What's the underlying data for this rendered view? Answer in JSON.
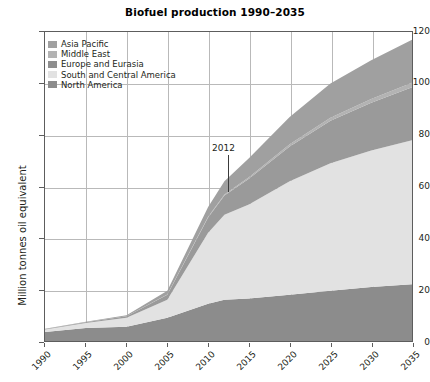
{
  "chart_data": {
    "type": "area",
    "title": "Biofuel production 1990–2035",
    "xlabel": "",
    "ylabel": "Million tonnes oil equivalent",
    "xlim": [
      1990,
      2035
    ],
    "ylim": [
      0,
      120
    ],
    "yticks": [
      0,
      20,
      40,
      60,
      80,
      100,
      120
    ],
    "xticks": [
      1990,
      1995,
      2000,
      2005,
      2010,
      2015,
      2020,
      2025,
      2030,
      2035
    ],
    "grid": true,
    "stacked": true,
    "legend_position": "top-left",
    "x": [
      1990,
      1995,
      2000,
      2005,
      2010,
      2012,
      2015,
      2020,
      2025,
      2030,
      2035
    ],
    "series": [
      {
        "name": "North America",
        "color": "#8c8c8c",
        "order": 1,
        "values": [
          3.5,
          5.0,
          5.5,
          9.0,
          14.5,
          16.0,
          16.5,
          18.0,
          19.5,
          21.0,
          22.0
        ]
      },
      {
        "name": "South and Central America",
        "color": "#e2e2e2",
        "order": 2,
        "values": [
          1.0,
          2.0,
          3.5,
          7.0,
          27.5,
          33.0,
          36.5,
          44.0,
          49.5,
          53.0,
          56.0
        ]
      },
      {
        "name": "Europe and Eurasia",
        "color": "#9a9a9a",
        "order": 3,
        "values": [
          0.2,
          0.3,
          0.6,
          2.0,
          6.0,
          7.5,
          10.0,
          13.5,
          16.5,
          18.5,
          20.5
        ]
      },
      {
        "name": "Middle East",
        "color": "#b3b3b3",
        "order": 4,
        "values": [
          0.0,
          0.0,
          0.0,
          0.1,
          0.3,
          0.4,
          0.6,
          0.9,
          1.2,
          1.5,
          1.8
        ]
      },
      {
        "name": "Asia Pacific",
        "color": "#a0a0a0",
        "order": 5,
        "values": [
          0.1,
          0.2,
          0.4,
          1.4,
          3.7,
          5.1,
          7.4,
          10.6,
          13.3,
          15.0,
          16.7
        ]
      }
    ],
    "totals": [
      4.8,
      7.5,
      10.0,
      19.5,
      52.0,
      62.0,
      71.0,
      87.0,
      100.0,
      109.0,
      117.0
    ],
    "annotations": [
      {
        "label": "2012",
        "x": 2012,
        "y": 70
      }
    ]
  },
  "legend": {
    "items": [
      {
        "label": "Asia Pacific",
        "color": "#a0a0a0"
      },
      {
        "label": "Middle East",
        "color": "#b3b3b3"
      },
      {
        "label": "Europe and Eurasia",
        "color": "#8e8e8e"
      },
      {
        "label": "South and Central America",
        "color": "#e2e2e2"
      },
      {
        "label": "North America",
        "color": "#8c8c8c"
      }
    ]
  },
  "axis": {
    "y_labels": [
      "120",
      "100",
      "80",
      "60",
      "40",
      "20",
      "0"
    ],
    "x_labels": [
      "1990",
      "1995",
      "2000",
      "2005",
      "2010",
      "2015",
      "2020",
      "2025",
      "2030",
      "2035"
    ],
    "y_title": "Million tonnes oil equivalent"
  },
  "annotation": {
    "label": "2012"
  },
  "colors": {
    "frame": "#5d5d5d",
    "grid": "#b9b9b9",
    "text": "#231f20",
    "background": "#ffffff"
  }
}
